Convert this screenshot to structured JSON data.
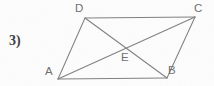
{
  "figure": {
    "problem_number": "3)",
    "shape_name": "parallelogram-with-diagonals",
    "stroke_color": "#808080",
    "label_color": "#6e6e6e",
    "background_color": "#fdfdfd",
    "vertex_labels": {
      "D": "D",
      "C": "C",
      "A": "A",
      "B": "B",
      "E": "E"
    },
    "points": {
      "A": {
        "x": 58,
        "y": 79
      },
      "B": {
        "x": 167,
        "y": 78
      },
      "C": {
        "x": 195,
        "y": 17
      },
      "D": {
        "x": 85,
        "y": 18
      },
      "E": {
        "x": 126,
        "y": 48
      }
    },
    "segments": [
      {
        "name": "side-DC",
        "from": "D",
        "to": "C"
      },
      {
        "name": "side-CB",
        "from": "C",
        "to": "B"
      },
      {
        "name": "side-BA",
        "from": "B",
        "to": "A"
      },
      {
        "name": "side-AD",
        "from": "A",
        "to": "D"
      },
      {
        "name": "diagonal-AC",
        "from": "A",
        "to": "C"
      },
      {
        "name": "diagonal-DB",
        "from": "D",
        "to": "B"
      }
    ]
  }
}
